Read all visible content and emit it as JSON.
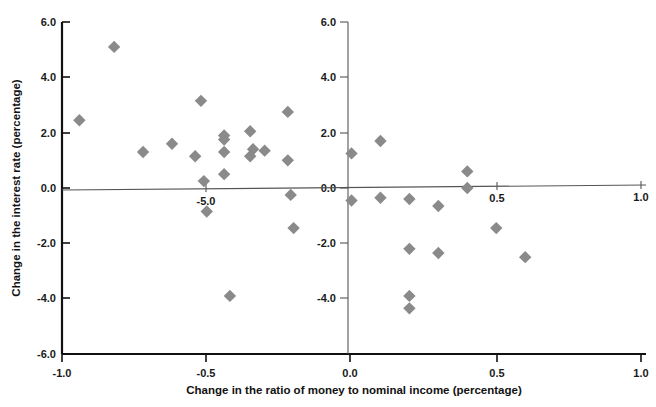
{
  "chart_data": {
    "type": "scatter",
    "title": "",
    "xlabel": "Change in the ratio of money to nominal income (percentage)",
    "ylabel": "Change in the interest rate (percentage)",
    "xlim": [
      -1.0,
      1.0
    ],
    "ylim": [
      -6.0,
      6.0
    ],
    "grid": false,
    "legend": null,
    "marker_color": "#8a8a8a",
    "marker_shape": "diamond",
    "xticks_bottom": [
      "-1.0",
      "-0.5",
      "0.0",
      "0.5",
      "1.0"
    ],
    "xtick_values_bottom": [
      -1.0,
      -0.5,
      0.0,
      0.5,
      1.0
    ],
    "xticks_inner": [
      "-5.0",
      "0.5",
      "1.0"
    ],
    "xtick_values_inner": [
      -0.5,
      0.5,
      1.0
    ],
    "yticks_left": [
      "6.0",
      "4.0",
      "2.0",
      "0.0",
      "-2.0",
      "-4.0",
      "-6.0"
    ],
    "ytick_values_left": [
      6.0,
      4.0,
      2.0,
      0.0,
      -2.0,
      -4.0,
      -6.0
    ],
    "yticks_center": [
      "6.0",
      "4.0",
      "2.0",
      "0.0",
      "-2.0",
      "-4.0"
    ],
    "ytick_values_center": [
      6.0,
      4.0,
      2.0,
      0.0,
      -2.0,
      -4.0
    ],
    "center_axis_x": 0.0,
    "zero_line_y": 0.0,
    "points": [
      {
        "x": -0.82,
        "y": 5.1
      },
      {
        "x": -0.94,
        "y": 2.45
      },
      {
        "x": -0.72,
        "y": 1.3
      },
      {
        "x": -0.62,
        "y": 1.6
      },
      {
        "x": -0.52,
        "y": 3.15
      },
      {
        "x": -0.54,
        "y": 1.15
      },
      {
        "x": -0.51,
        "y": 0.25
      },
      {
        "x": -0.5,
        "y": -0.85
      },
      {
        "x": -0.44,
        "y": 1.9
      },
      {
        "x": -0.44,
        "y": 1.75
      },
      {
        "x": -0.44,
        "y": 1.3
      },
      {
        "x": -0.44,
        "y": 0.5
      },
      {
        "x": -0.42,
        "y": -3.9
      },
      {
        "x": -0.35,
        "y": 2.05
      },
      {
        "x": -0.34,
        "y": 1.4
      },
      {
        "x": -0.35,
        "y": 1.15
      },
      {
        "x": -0.3,
        "y": 1.35
      },
      {
        "x": -0.22,
        "y": 2.75
      },
      {
        "x": -0.22,
        "y": 1.0
      },
      {
        "x": -0.21,
        "y": -0.25
      },
      {
        "x": -0.2,
        "y": -1.45
      },
      {
        "x": 0.0,
        "y": 1.25
      },
      {
        "x": 0.0,
        "y": -0.45
      },
      {
        "x": 0.1,
        "y": 1.7
      },
      {
        "x": 0.1,
        "y": -0.35
      },
      {
        "x": 0.2,
        "y": -0.4
      },
      {
        "x": 0.2,
        "y": -2.2
      },
      {
        "x": 0.2,
        "y": -3.9
      },
      {
        "x": 0.2,
        "y": -4.35
      },
      {
        "x": 0.3,
        "y": -0.65
      },
      {
        "x": 0.3,
        "y": -2.35
      },
      {
        "x": 0.4,
        "y": 0.6
      },
      {
        "x": 0.4,
        "y": 0.0
      },
      {
        "x": 0.5,
        "y": -1.45
      },
      {
        "x": 0.6,
        "y": -2.5
      }
    ]
  }
}
